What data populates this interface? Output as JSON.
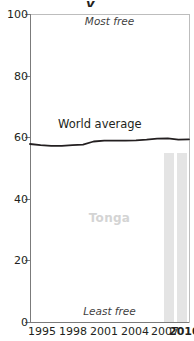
{
  "chart_data": {
    "type": "line",
    "title": "",
    "xlabel": "",
    "ylabel": "",
    "xlim": [
      1995,
      2010
    ],
    "ylim": [
      0,
      100
    ],
    "grid": false,
    "legend_position": "inline-annotation",
    "x_ticks": [
      "1995",
      "1998",
      "2001",
      "2004",
      "2007",
      "2010"
    ],
    "x_tick_values": [
      1995,
      1998,
      2001,
      2004,
      2007,
      2010
    ],
    "y_ticks": [
      "0",
      "20",
      "40",
      "60",
      "80",
      "100"
    ],
    "y_tick_values": [
      0,
      20,
      40,
      60,
      80,
      100
    ],
    "annotations": {
      "top_axis_note": "Most free",
      "bottom_axis_note": "Least free",
      "watermark": "Tonga",
      "series_label": "World average"
    },
    "series": [
      {
        "name": "World average",
        "type": "line",
        "color": "#231f20",
        "x": [
          1995,
          1996,
          1997,
          1998,
          1999,
          2000,
          2001,
          2002,
          2003,
          2004,
          2005,
          2006,
          2007,
          2008,
          2009,
          2010
        ],
        "values": [
          57.8,
          57.4,
          57.2,
          57.2,
          57.4,
          57.6,
          58.6,
          58.9,
          58.9,
          58.9,
          59.0,
          59.2,
          59.5,
          59.6,
          59.2,
          59.3
        ]
      },
      {
        "name": "Tonga",
        "type": "bar",
        "color": "#e4e4e4",
        "x": [
          2009,
          2010
        ],
        "values": [
          55.0,
          55.0
        ]
      }
    ]
  },
  "axis": {
    "y_title": "",
    "x_title": ""
  }
}
